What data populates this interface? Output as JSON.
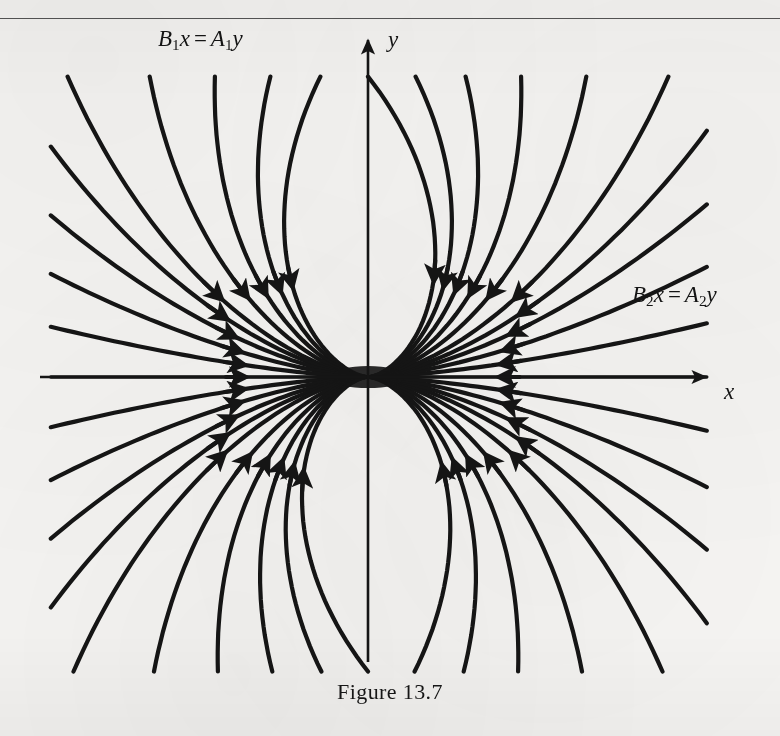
{
  "page": {
    "background_color": "#f6f5f3",
    "ink_color": "#151515",
    "width": 780,
    "height": 736
  },
  "header_rule": {
    "present": true,
    "color": "#3a3a3a"
  },
  "caption": {
    "text": "Figure 13.7"
  },
  "labels": {
    "asymptote_1": {
      "B": "B",
      "sub1": "1",
      "x": "x",
      "eq": "=",
      "A": "A",
      "sub2": "1",
      "y": "y"
    },
    "asymptote_2": {
      "B": "B",
      "sub1": "2",
      "x": "x",
      "eq": "=",
      "A": "A",
      "sub2": "2",
      "y": "y"
    },
    "axis_x": "x",
    "axis_y": "y"
  },
  "chart_data": {
    "type": "line",
    "title": "Figure 13.7",
    "subtitle": "Phase portrait: improper (degenerate) node at the origin",
    "xlabel": "x",
    "ylabel": "y",
    "grid": false,
    "legend": null,
    "axes": {
      "origin_px": [
        368,
        377
      ],
      "x_axis": {
        "from_px": [
          40,
          377
        ],
        "to_px": [
          714,
          377
        ],
        "arrow_at": "right"
      },
      "y_axis": {
        "from_px": [
          368,
          660
        ],
        "to_px": [
          368,
          32
        ],
        "arrow_at": "top"
      }
    },
    "annotations": [
      {
        "text": "B1x = A1y",
        "at_px": [
          158,
          38
        ],
        "describes": "asymptote line in second quadrant"
      },
      {
        "text": "B2x = A2y",
        "at_px": [
          632,
          294
        ],
        "describes": "asymptote line in first quadrant"
      }
    ],
    "flow_direction": "inward toward the origin (stable node); all arrowheads point toward (0,0)",
    "trajectory_count": 40,
    "trajectories": [
      {
        "angle_deg": 0,
        "tangent": "x-axis positive"
      },
      {
        "angle_deg": 9,
        "tangent": "shallow"
      },
      {
        "angle_deg": 18,
        "tangent": "shallow"
      },
      {
        "angle_deg": 27,
        "tangent": "asymptote B2x = A2y"
      },
      {
        "angle_deg": 36,
        "tangent": "medium"
      },
      {
        "angle_deg": 45,
        "tangent": "medium"
      },
      {
        "angle_deg": 54,
        "tangent": "medium"
      },
      {
        "angle_deg": 63,
        "tangent": "steep"
      },
      {
        "angle_deg": 72,
        "tangent": "steep"
      },
      {
        "angle_deg": 81,
        "tangent": "steep"
      },
      {
        "angle_deg": 90,
        "tangent": "y-axis positive"
      },
      {
        "angle_deg": 99,
        "tangent": "steep"
      },
      {
        "angle_deg": 108,
        "tangent": "steep"
      },
      {
        "angle_deg": 117,
        "tangent": "medium"
      },
      {
        "angle_deg": 126,
        "tangent": "medium"
      },
      {
        "angle_deg": 135,
        "tangent": "asymptote B1x = A1y"
      },
      {
        "angle_deg": 144,
        "tangent": "medium"
      },
      {
        "angle_deg": 153,
        "tangent": "shallow"
      },
      {
        "angle_deg": 162,
        "tangent": "shallow"
      },
      {
        "angle_deg": 171,
        "tangent": "shallow"
      },
      {
        "angle_deg": 180,
        "tangent": "x-axis negative"
      },
      {
        "angle_deg": 189,
        "tangent": "shallow"
      },
      {
        "angle_deg": 198,
        "tangent": "shallow"
      },
      {
        "angle_deg": 207,
        "tangent": "medium"
      },
      {
        "angle_deg": 216,
        "tangent": "medium"
      },
      {
        "angle_deg": 225,
        "tangent": "medium"
      },
      {
        "angle_deg": 234,
        "tangent": "steep"
      },
      {
        "angle_deg": 243,
        "tangent": "steep"
      },
      {
        "angle_deg": 252,
        "tangent": "steep"
      },
      {
        "angle_deg": 261,
        "tangent": "steep"
      },
      {
        "angle_deg": 270,
        "tangent": "y-axis negative"
      },
      {
        "angle_deg": 279,
        "tangent": "steep"
      },
      {
        "angle_deg": 288,
        "tangent": "steep"
      },
      {
        "angle_deg": 297,
        "tangent": "medium"
      },
      {
        "angle_deg": 306,
        "tangent": "medium"
      },
      {
        "angle_deg": 315,
        "tangent": "medium"
      },
      {
        "angle_deg": 324,
        "tangent": "shallow"
      },
      {
        "angle_deg": 333,
        "tangent": "shallow"
      },
      {
        "angle_deg": 342,
        "tangent": "shallow"
      },
      {
        "angle_deg": 351,
        "tangent": "shallow"
      }
    ]
  }
}
